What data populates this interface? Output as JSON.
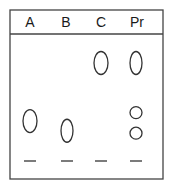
{
  "diagram": {
    "type": "tlc-plate",
    "colors": {
      "outline": "#444444",
      "spot": "#333333",
      "background": "#ffffff"
    },
    "lanes": [
      {
        "label": "A",
        "spots": [
          {
            "shape": "ellipse",
            "rf": 0.33
          }
        ]
      },
      {
        "label": "B",
        "spots": [
          {
            "shape": "ellipse",
            "rf": 0.25
          }
        ]
      },
      {
        "label": "C",
        "spots": [
          {
            "shape": "ellipse",
            "rf": 0.81
          }
        ]
      },
      {
        "label": "Pr",
        "spots": [
          {
            "shape": "ellipse",
            "rf": 0.81
          },
          {
            "shape": "circle",
            "rf": 0.4
          },
          {
            "shape": "circle",
            "rf": 0.23
          }
        ]
      }
    ]
  }
}
